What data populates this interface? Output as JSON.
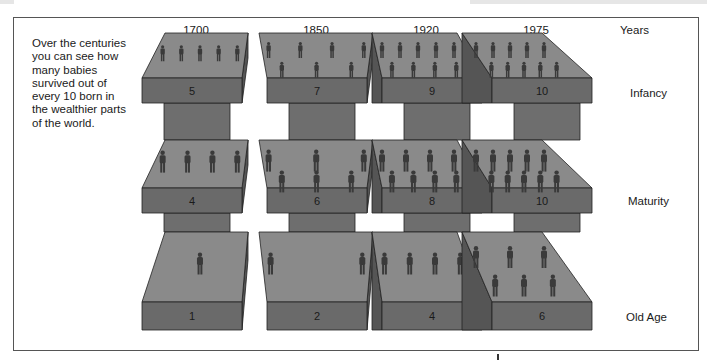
{
  "intro_text": "Over the centuries you can see how many babies survived out of every 10 born in the wealthier parts of the world.",
  "labels": {
    "years": "Years",
    "infancy": "Infancy",
    "maturity": "Maturity",
    "old_age": "Old Age"
  },
  "columns": [
    {
      "year": "1700",
      "infancy": "5",
      "maturity": "4",
      "old_age": "1"
    },
    {
      "year": "1850",
      "infancy": "7",
      "maturity": "6",
      "old_age": "2"
    },
    {
      "year": "1920",
      "infancy": "9",
      "maturity": "8",
      "old_age": "4"
    },
    {
      "year": "1975",
      "infancy": "10",
      "maturity": "10",
      "old_age": "6"
    }
  ],
  "colors": {
    "top_face": "#8a8a8a",
    "front_face": "#6a6a6a",
    "side_face": "#555555",
    "pillar": "#6e6e6e",
    "figure": "#3a3a3a",
    "outline": "#222222"
  }
}
